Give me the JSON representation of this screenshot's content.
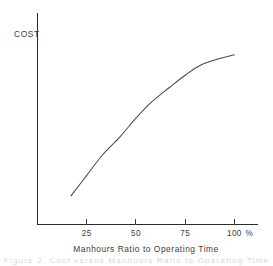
{
  "chart_data": {
    "type": "line",
    "title": "",
    "xlabel": "Manhours Ratio to Operating Time",
    "ylabel": "COST",
    "x_unit_suffix": "%",
    "xlim": [
      0,
      112
    ],
    "ylim": [
      0,
      100
    ],
    "grid": false,
    "legend": null,
    "x_tick_labels": [
      "25",
      "50",
      "75",
      "100"
    ],
    "x_tick_values": [
      25,
      50,
      75,
      100
    ],
    "y_tick_labels": [],
    "series": [
      {
        "name": "Cost vs Manhours Ratio",
        "x": [
          17,
          25,
          33,
          42,
          50,
          58,
          67,
          75,
          83,
          92,
          100
        ],
        "values": [
          14,
          24,
          34,
          43,
          52,
          60,
          67,
          73,
          78,
          81,
          83
        ]
      }
    ],
    "annotations": []
  },
  "axis": {
    "y_label": "COST",
    "x_label": "Manhours Ratio to Operating Time",
    "x_unit": "%"
  },
  "footer": {
    "ghost_text": "Figure 2.  Cost versus Manhours Ratio to Operating Time"
  }
}
